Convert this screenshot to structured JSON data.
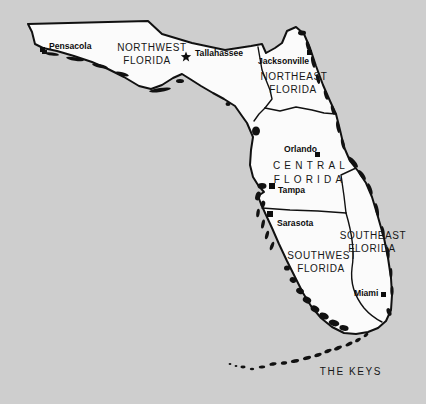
{
  "canvas": {
    "background_color": "#cecece",
    "land_color": "#fbfbfb",
    "line_color": "#111111"
  },
  "map": {
    "name": "Florida regions map",
    "regions": [
      {
        "id": "northwest",
        "line1": "NORTHWEST",
        "line2": "FLORIDA"
      },
      {
        "id": "northeast",
        "line1": "NORTHEAST",
        "line2": "FLORIDA"
      },
      {
        "id": "central",
        "line1": "CENTRAL",
        "line2": "FLORIDA"
      },
      {
        "id": "southwest",
        "line1": "SOUTHWEST",
        "line2": "FLORIDA"
      },
      {
        "id": "southeast",
        "line1": "SOUTHEAST",
        "line2": "FLORIDA"
      },
      {
        "id": "keys",
        "line1": "THE KEYS"
      }
    ],
    "cities": [
      {
        "name": "Pensacola",
        "marker": "square"
      },
      {
        "name": "Tallahassee",
        "marker": "star"
      },
      {
        "name": "Jacksonville",
        "marker": "square"
      },
      {
        "name": "Orlando",
        "marker": "square"
      },
      {
        "name": "Tampa",
        "marker": "square"
      },
      {
        "name": "Sarasota",
        "marker": "square"
      },
      {
        "name": "Miami",
        "marker": "square"
      }
    ]
  }
}
